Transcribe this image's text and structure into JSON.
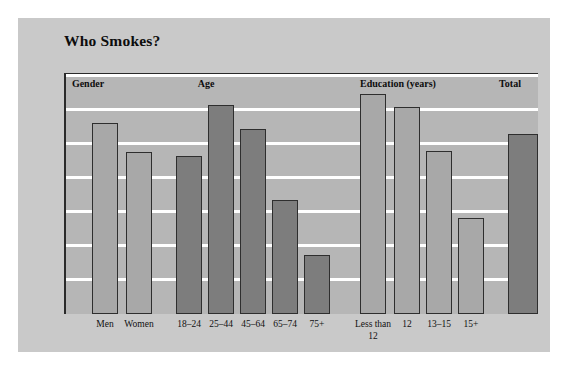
{
  "figure": {
    "title": "Who Smokes?",
    "background_color": "#c9c9c9",
    "plot_background_color": "#b6b6b6",
    "gridline_color": "#ffffff",
    "axis_color": "#2a2a2a"
  },
  "chart_data": {
    "type": "bar",
    "title": "Who Smokes?",
    "xlabel": "",
    "ylabel": "",
    "ylim": [
      0,
      35
    ],
    "grid": true,
    "legend": "none",
    "ytick_labels": [
      "0%",
      "5%",
      "10%",
      "15%",
      "20%",
      "25%",
      "30%",
      "35%"
    ],
    "ytick_values": [
      0,
      5,
      10,
      15,
      20,
      25,
      30,
      35
    ],
    "group_headers": [
      "Gender",
      "Age",
      "Education (years)",
      "Total"
    ],
    "categories": [
      "Men",
      "Women",
      "18–24",
      "25–44",
      "45–64",
      "65–74",
      "75+",
      "Less than\n12",
      "12",
      "13–15",
      "15+",
      ""
    ],
    "values": [
      28.0,
      23.7,
      23.1,
      30.6,
      27.1,
      16.7,
      8.7,
      32.2,
      30.3,
      23.9,
      14.1,
      26.4
    ],
    "bars": [
      {
        "label": "Men",
        "value": 28.0,
        "group": "Gender",
        "shade": "light"
      },
      {
        "label": "Women",
        "value": 23.7,
        "group": "Gender",
        "shade": "light"
      },
      {
        "label": "18–24",
        "value": 23.1,
        "group": "Age",
        "shade": "dark"
      },
      {
        "label": "25–44",
        "value": 30.6,
        "group": "Age",
        "shade": "dark"
      },
      {
        "label": "45–64",
        "value": 27.1,
        "group": "Age",
        "shade": "dark"
      },
      {
        "label": "65–74",
        "value": 16.7,
        "group": "Age",
        "shade": "dark"
      },
      {
        "label": "75+",
        "value": 8.7,
        "group": "Age",
        "shade": "dark"
      },
      {
        "label": "Less than\n12",
        "value": 32.2,
        "group": "Education (years)",
        "shade": "light"
      },
      {
        "label": "12",
        "value": 30.3,
        "group": "Education (years)",
        "shade": "light"
      },
      {
        "label": "13–15",
        "value": 23.9,
        "group": "Education (years)",
        "shade": "light"
      },
      {
        "label": "15+",
        "value": 14.1,
        "group": "Education (years)",
        "shade": "light"
      },
      {
        "label": "",
        "value": 26.4,
        "group": "Total",
        "shade": "dark"
      }
    ]
  }
}
